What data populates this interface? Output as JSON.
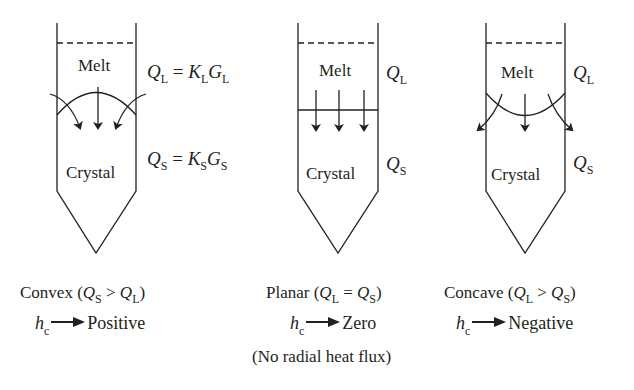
{
  "diagram": {
    "panels": [
      {
        "id": "convex",
        "top_label": "Melt",
        "bottom_label": "Crystal",
        "q_liquid": {
          "symbol": "Q",
          "sub": "L",
          "eq": " = ",
          "k": "K",
          "k_sub": "L",
          "g": "G",
          "g_sub": "L"
        },
        "q_solid": {
          "symbol": "Q",
          "sub": "S",
          "eq": " = ",
          "k": "K",
          "k_sub": "S",
          "g": "G",
          "g_sub": "S"
        },
        "caption": {
          "name": "Convex (",
          "a": "Q",
          "a_sub": "S",
          "op": " > ",
          "b": "Q",
          "b_sub": "L",
          "close": ")"
        },
        "hc": {
          "h": "h",
          "sub": "c",
          "result": "Positive"
        },
        "interface": "convex"
      },
      {
        "id": "planar",
        "top_label": "Melt",
        "bottom_label": "Crystal",
        "q_liquid": {
          "symbol": "Q",
          "sub": "L"
        },
        "q_solid": {
          "symbol": "Q",
          "sub": "S"
        },
        "caption": {
          "name": "Planar (",
          "a": "Q",
          "a_sub": "L",
          "op": " = ",
          "b": "Q",
          "b_sub": "S",
          "close": ")"
        },
        "hc": {
          "h": "h",
          "sub": "c",
          "result": "Zero"
        },
        "note": "(No radial heat flux)",
        "interface": "planar"
      },
      {
        "id": "concave",
        "top_label": "Melt",
        "bottom_label": "Crystal",
        "q_liquid": {
          "symbol": "Q",
          "sub": "L"
        },
        "q_solid": {
          "symbol": "Q",
          "sub": "S"
        },
        "caption": {
          "name": "Concave (",
          "a": "Q",
          "a_sub": "L",
          "op": " > ",
          "b": "Q",
          "b_sub": "S",
          "close": ")"
        },
        "hc": {
          "h": "h",
          "sub": "c",
          "result": "Negative"
        },
        "interface": "concave"
      }
    ],
    "colors": {
      "ink": "#231f20",
      "background": "#ffffff"
    }
  }
}
